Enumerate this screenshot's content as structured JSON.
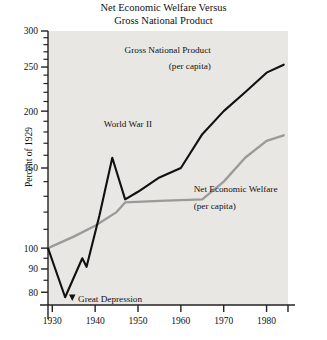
{
  "chart_data": {
    "type": "line",
    "title": "Net Economic Welfare Versus Gross National Product",
    "title_lines": [
      "Net Economic Welfare Versus",
      "Gross National Product"
    ],
    "xlabel": "",
    "ylabel": "Percent of 1929",
    "yscale": "log",
    "ylim": [
      75,
      300
    ],
    "xlim": [
      1929,
      1985
    ],
    "grid": false,
    "legend": "inline-annotations",
    "plot_background": "#e9e7e4",
    "y_ticks": [
      80,
      90,
      100,
      150,
      200,
      250,
      300
    ],
    "y_tick_labels": [
      "80",
      "90",
      "100",
      "150",
      "200",
      "250",
      "300"
    ],
    "x_ticks": [
      1930,
      1940,
      1950,
      1960,
      1970,
      1980,
      1985
    ],
    "x_tick_labels": [
      "1930",
      "1940",
      "1950",
      "1960",
      "1970",
      "1980",
      ""
    ],
    "series": [
      {
        "name": "Gross National Product (per capita)",
        "color": "#111111",
        "label_lines": [
          "Gross National Product",
          "(per capita)"
        ],
        "x": [
          1929,
          1933,
          1937,
          1938,
          1941,
          1944,
          1947,
          1950,
          1955,
          1960,
          1965,
          1970,
          1975,
          1980,
          1984
        ],
        "values": [
          100,
          78,
          95,
          91,
          118,
          158,
          128,
          133,
          143,
          150,
          178,
          200,
          220,
          243,
          253
        ]
      },
      {
        "name": "Net Economic Welfare (per capita)",
        "color": "#9a9a96",
        "label_lines": [
          "Net Economic Welfare",
          "(per capita)"
        ],
        "x": [
          1929,
          1935,
          1940,
          1945,
          1947,
          1955,
          1965,
          1970,
          1975,
          1980,
          1984
        ],
        "values": [
          100,
          106,
          112,
          120,
          126,
          127,
          128,
          140,
          158,
          172,
          177
        ]
      }
    ],
    "annotations": [
      {
        "text": "World War II",
        "x": 1942,
        "y": 185,
        "marker": "none"
      },
      {
        "text": "Great Depression",
        "x": 1936,
        "y": 76,
        "marker": "down-triangle"
      },
      {
        "text": "Gross National Product",
        "x": 1967,
        "y": 268,
        "marker": "none"
      },
      {
        "text": "(per capita)",
        "x": 1967,
        "y": 248,
        "marker": "none"
      },
      {
        "text": "Net Economic Welfare",
        "x": 1963,
        "y": 133,
        "marker": "none"
      },
      {
        "text": "(per capita)",
        "x": 1963,
        "y": 122,
        "marker": "none"
      }
    ]
  }
}
